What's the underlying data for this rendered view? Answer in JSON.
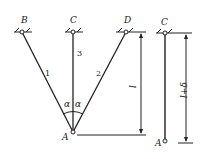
{
  "diagram": {
    "left": {
      "supports": [
        {
          "label": "B",
          "x": 22,
          "y": 32
        },
        {
          "label": "C",
          "x": 73,
          "y": 32
        },
        {
          "label": "D",
          "x": 126,
          "y": 32
        }
      ],
      "joint": {
        "label": "A",
        "x": 73,
        "y": 132
      },
      "bars": [
        {
          "label": "1",
          "from": "B"
        },
        {
          "label": "3",
          "from": "C"
        },
        {
          "label": "2",
          "from": "D"
        }
      ],
      "angles": [
        "α",
        "α"
      ],
      "dimension": {
        "label": "l"
      }
    },
    "right": {
      "support": {
        "label": "C",
        "x": 165,
        "y": 33
      },
      "end": {
        "label": "A",
        "x": 165,
        "y": 141
      },
      "dimension": {
        "label": "l+δ"
      }
    }
  }
}
